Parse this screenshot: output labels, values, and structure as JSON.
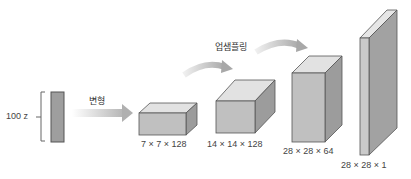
{
  "diagram": {
    "input": {
      "label": "100 z"
    },
    "arrows": {
      "reshape_label": "변형",
      "upsample_label": "업샘플링"
    },
    "blocks": [
      {
        "label": "7 × 7 × 128"
      },
      {
        "label": "14 × 14 × 128"
      },
      {
        "label": "28 × 28 × 64"
      },
      {
        "label": "28 × 28 × 1"
      }
    ],
    "colors": {
      "front": "#bdbdbd",
      "top": "#e0e0e0",
      "side": "#9a9a9a",
      "stroke": "#555555",
      "arrow": "#bcbcbc"
    }
  }
}
